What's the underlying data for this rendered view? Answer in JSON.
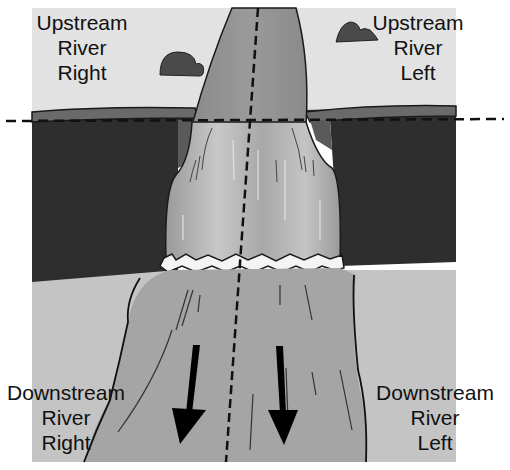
{
  "diagram": {
    "labels": {
      "upstream_right": {
        "line1": "Upstream",
        "line2": "River",
        "line3": "Right"
      },
      "upstream_left": {
        "line1": "Upstream",
        "line2": "River",
        "line3": "Left"
      },
      "downstream_right": {
        "line1": "Downstream",
        "line2": "River",
        "line3": "Right"
      },
      "downstream_left": {
        "line1": "Downstream",
        "line2": "River",
        "line3": "Left"
      }
    },
    "elements": {
      "centerline": "dashed vertical river centerline",
      "brink_line": "dashed horizontal line at waterfall brink",
      "flow_arrows": [
        "flow-arrow-left",
        "flow-arrow-right"
      ],
      "flow_direction": "down (downstream)"
    },
    "colors": {
      "sky": "#e2e2e2",
      "cliff": "#2e2e2e",
      "cliff_top": "#6a6a6a",
      "upper_river": "#8c8c8c",
      "falls": "#b4b4b4",
      "foam": "#f4f4f4",
      "lower_river": "#a5a5a5",
      "ground": "#c4c4c4",
      "outline": "#111111"
    }
  }
}
